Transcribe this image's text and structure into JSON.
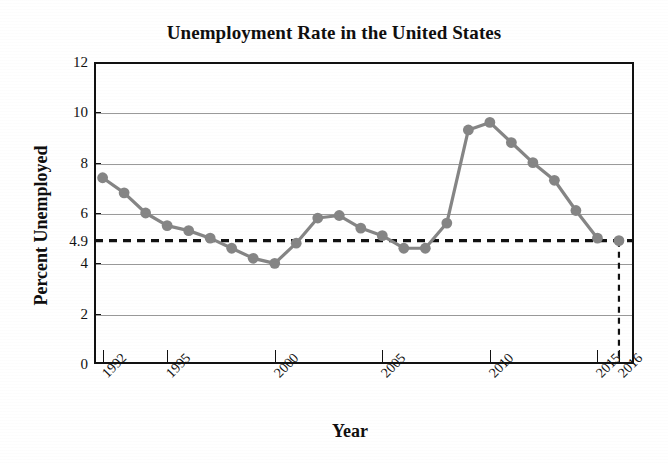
{
  "chart_data": {
    "type": "line",
    "title": "Unemployment Rate in the United States",
    "xlabel": "Year",
    "ylabel": "Percent Unemployed",
    "xlim": [
      1991.6,
      2016.7
    ],
    "ylim": [
      0,
      12
    ],
    "grid": true,
    "legend": "none",
    "series_color": "#858585",
    "x": [
      1992,
      1993,
      1994,
      1995,
      1996,
      1997,
      1998,
      1999,
      2000,
      2001,
      2002,
      2003,
      2004,
      2005,
      2006,
      2007,
      2008,
      2009,
      2010,
      2011,
      2012,
      2013,
      2014,
      2015,
      2016
    ],
    "values": [
      7.4,
      6.8,
      6.0,
      5.5,
      5.3,
      5.0,
      4.6,
      4.2,
      4.0,
      4.8,
      5.8,
      5.9,
      5.4,
      5.1,
      4.6,
      4.6,
      5.6,
      9.3,
      9.6,
      8.8,
      8.0,
      7.3,
      6.1,
      5.0,
      4.9
    ],
    "y_tick_labels": [
      "0",
      "2",
      "4",
      "6",
      "8",
      "10",
      "12"
    ],
    "y_tick_values": [
      0,
      2,
      4,
      6,
      8,
      10,
      12
    ],
    "x_tick_labels": [
      "1992",
      "1995",
      "2000",
      "2005",
      "2010",
      "2015",
      "2016"
    ],
    "x_tick_values": [
      1992,
      1995,
      2000,
      2005,
      2010,
      2015,
      2016
    ],
    "annotations": [
      {
        "name": "reference-line-horizontal",
        "label": "4.9",
        "value": 4.9,
        "orientation": "horizontal",
        "style": "dashed",
        "color": "#111111"
      },
      {
        "name": "reference-line-vertical",
        "label": "2016",
        "value": 2016,
        "orientation": "vertical",
        "style": "dashed",
        "color": "#111111"
      }
    ]
  },
  "chart": {
    "title": "Unemployment Rate in the United States",
    "xlabel": "Year",
    "ylabel": "Percent Unemployed",
    "special_y_label": "4.9"
  }
}
